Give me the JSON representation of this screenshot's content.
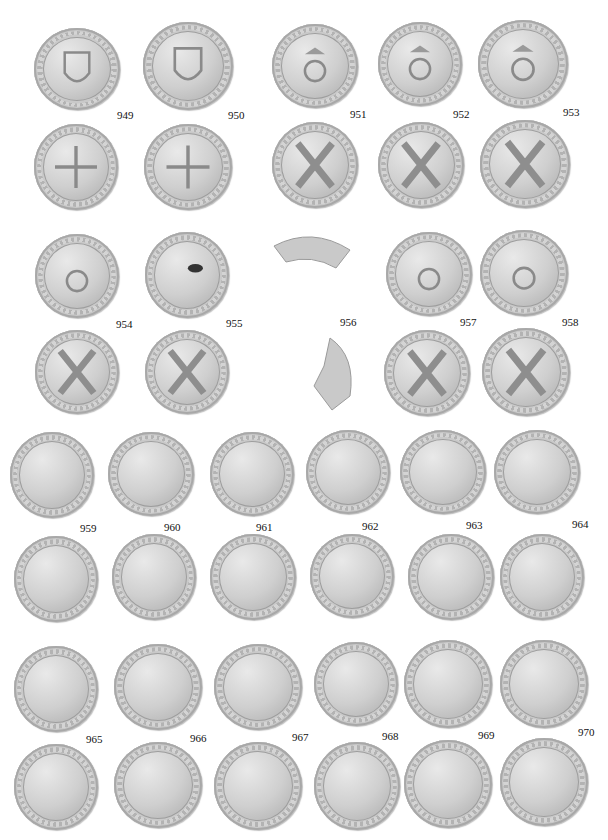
{
  "plate": {
    "description": "Plate of Scottish billon coins (placks/groats), obverse and reverse",
    "catalogue_numbers": [
      "949",
      "950",
      "951",
      "952",
      "953",
      "954",
      "955",
      "956",
      "957",
      "958",
      "959",
      "960",
      "961",
      "962",
      "963",
      "964",
      "965",
      "966",
      "967",
      "968",
      "969",
      "970"
    ],
    "labels": {
      "n949": "949",
      "n950": "950",
      "n951": "951",
      "n952": "952",
      "n953": "953",
      "n954": "954",
      "n955": "955",
      "n956": "956",
      "n957": "957",
      "n958": "958",
      "n959": "959",
      "n960": "960",
      "n961": "961",
      "n962": "962",
      "n963": "963",
      "n964": "964",
      "n965": "965",
      "n966": "966",
      "n967": "967",
      "n968": "968",
      "n969": "969",
      "n970": "970"
    },
    "coin_types": {
      "shield": "obverse: crowned shield of arms",
      "thistle": "obverse: crowned thistle head between I S",
      "cross_fleury": "reverse: floriated cross",
      "saltire": "reverse: saltire cross with fleurs-de-lis",
      "fragment": "fragmentary coin"
    },
    "colors": {
      "background": "#ffffff",
      "coin_silver": "#c8c8c8",
      "text": "#111111"
    }
  }
}
